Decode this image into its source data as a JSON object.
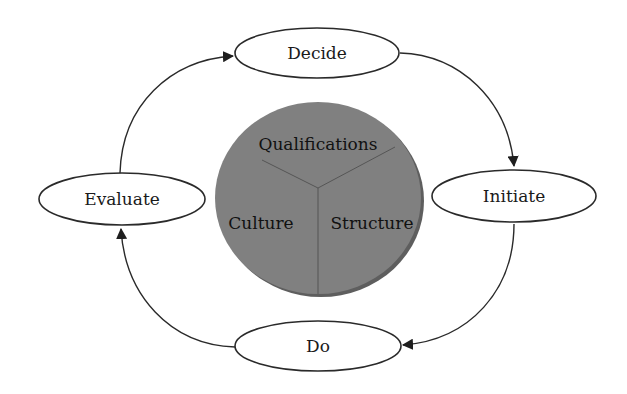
{
  "diagram": {
    "type": "cycle",
    "colors": {
      "stroke": "#2a2a2a",
      "node_fill": "#ffffff",
      "circle_fill": "#808080",
      "circle_shadow": "#5e5e5e",
      "divider": "#4a4a4a"
    },
    "nodes": [
      {
        "id": "decide",
        "label": "Decide"
      },
      {
        "id": "initiate",
        "label": "Initiate"
      },
      {
        "id": "do",
        "label": "Do"
      },
      {
        "id": "evaluate",
        "label": "Evaluate"
      }
    ],
    "edges": [
      {
        "from": "decide",
        "to": "initiate"
      },
      {
        "from": "initiate",
        "to": "do"
      },
      {
        "from": "do",
        "to": "evaluate"
      },
      {
        "from": "evaluate",
        "to": "decide"
      }
    ],
    "center_circle": {
      "segments": [
        {
          "label": "Qualifications"
        },
        {
          "label": "Culture"
        },
        {
          "label": "Structure"
        }
      ]
    }
  }
}
